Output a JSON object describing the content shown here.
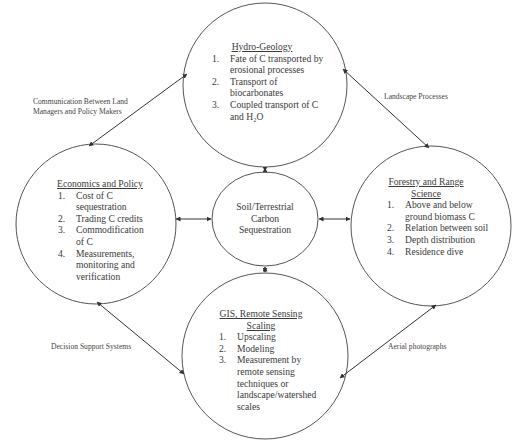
{
  "diagram": {
    "center": {
      "lines": [
        "Soil/Terrestrial",
        "Carbon",
        "Sequestration"
      ]
    },
    "nodes": {
      "hydro": {
        "title": "Hydro-Geology",
        "items": [
          {
            "num": "1.",
            "text": "Fate of C transported by erosional processes"
          },
          {
            "num": "2.",
            "text": "Transport of biocarbonates"
          },
          {
            "num": "3.",
            "text": "Coupled transport of C and H₂O"
          }
        ]
      },
      "economics": {
        "title": "Economics and Policy",
        "items": [
          {
            "num": "1.",
            "text": "Cost of C sequestration"
          },
          {
            "num": "2.",
            "text": "Trading C credits"
          },
          {
            "num": "3.",
            "text": "Commodification of C"
          },
          {
            "num": "4.",
            "text": "Measurements, monitoring and verification"
          }
        ]
      },
      "forestry": {
        "title": "Forestry and Range Science",
        "items": [
          {
            "num": "1.",
            "text": "Above and below ground biomass C"
          },
          {
            "num": "2.",
            "text": "Relation between soil"
          },
          {
            "num": "3.",
            "text": "Depth distribution"
          },
          {
            "num": "4.",
            "text": "Residence dive"
          }
        ]
      },
      "gis": {
        "title": "GIS, Remote Sensing Scaling",
        "items": [
          {
            "num": "1.",
            "text": "Upscaling"
          },
          {
            "num": "2.",
            "text": "Modeling"
          },
          {
            "num": "3.",
            "text": "Measurement by remote sensing techniques or landscape/watershed scales"
          }
        ]
      }
    },
    "edge_labels": {
      "hydro_economics": [
        "Communication Between Land",
        "Managers and Policy Makers"
      ],
      "hydro_forestry": [
        "Landscape Processes"
      ],
      "economics_gis": [
        "Decision Support Systems"
      ],
      "forestry_gis": [
        "Aerial photographs"
      ]
    },
    "colors": {
      "stroke": "#555555",
      "text": "#3a3a3a",
      "background": "#ffffff"
    }
  }
}
